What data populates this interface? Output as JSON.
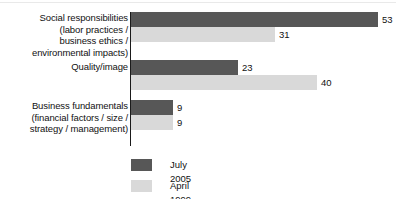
{
  "chart_data": {
    "type": "bar",
    "orientation": "horizontal",
    "title": "",
    "subtitle": "",
    "xlabel": "",
    "ylabel": "",
    "grid": false,
    "xlim": [
      0,
      53
    ],
    "legend_position": "bottom",
    "categories": [
      "Social responsibilities (labor practices / business ethics / environmental impacts)",
      "Quality/image",
      "Business fundamentals (financial factors / size / strategy / management)"
    ],
    "series": [
      {
        "name": "July 2005",
        "color": "#575757",
        "values": [
          53,
          23,
          9
        ]
      },
      {
        "name": "April 1999",
        "color": "#d9d9d9",
        "values": [
          31,
          40,
          9
        ]
      }
    ]
  },
  "chart": {
    "groups": [
      {
        "label_lines": [
          "Social responsibilities",
          "(labor practices /",
          "business ethics /",
          "environmental impacts)"
        ],
        "bars": [
          {
            "series": "July 2005",
            "value": 53,
            "value_label": "53"
          },
          {
            "series": "April 1999",
            "value": 31,
            "value_label": "31"
          }
        ]
      },
      {
        "label_lines": [
          "Quality/image"
        ],
        "bars": [
          {
            "series": "July 2005",
            "value": 23,
            "value_label": "23"
          },
          {
            "series": "April 1999",
            "value": 40,
            "value_label": "40"
          }
        ]
      },
      {
        "label_lines": [
          "Business fundamentals",
          "(financial factors / size /",
          "strategy / management)"
        ],
        "bars": [
          {
            "series": "July 2005",
            "value": 9,
            "value_label": "9"
          },
          {
            "series": "April 1999",
            "value": 9,
            "value_label": "9"
          }
        ]
      }
    ],
    "legend": [
      {
        "label": "July 2005",
        "color": "#575757"
      },
      {
        "label": "April 1999",
        "color": "#d9d9d9"
      }
    ],
    "colors": {
      "series_july_2005": "#575757",
      "series_april_1999": "#d9d9d9",
      "axis": "#1a1a1a",
      "text": "#111111",
      "background": "#ffffff"
    }
  }
}
